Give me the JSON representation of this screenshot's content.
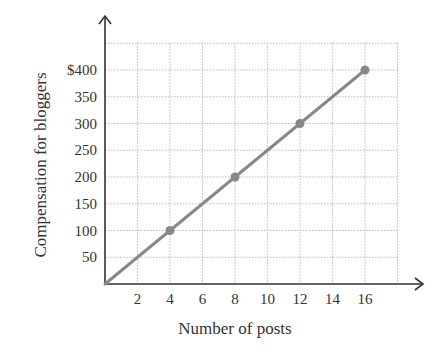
{
  "chart_data": {
    "type": "line",
    "title": "",
    "xlabel": "Number of posts",
    "ylabel": "Compensation for bloggers",
    "x": [
      0,
      4,
      8,
      12,
      16
    ],
    "series": [
      {
        "name": "Compensation",
        "values": [
          0,
          100,
          200,
          300,
          400
        ],
        "markers_at": [
          4,
          8,
          12,
          16
        ]
      }
    ],
    "x_ticks": [
      2,
      4,
      6,
      8,
      10,
      12,
      14,
      16
    ],
    "x_tick_labels": [
      "2",
      "4",
      "6",
      "8",
      "10",
      "12",
      "14",
      "16"
    ],
    "y_ticks": [
      50,
      100,
      150,
      200,
      250,
      300,
      350,
      400
    ],
    "y_tick_labels": [
      "50",
      "100",
      "150",
      "200",
      "250",
      "300",
      "350",
      "$400"
    ],
    "xlim": [
      0,
      18
    ],
    "ylim": [
      0,
      450
    ],
    "grid": true,
    "legend": null,
    "colors": {
      "line": "#888888",
      "marker": "#888888",
      "axis": "#333333",
      "grid": "#bbbbbb"
    }
  }
}
